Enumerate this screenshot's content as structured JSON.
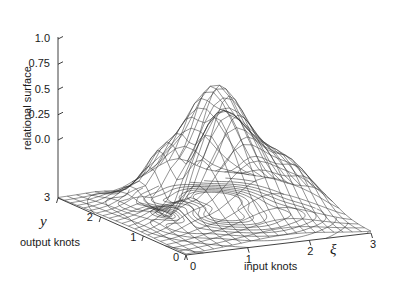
{
  "figure": {
    "width": 394,
    "height": 293,
    "background": "#ffffff",
    "line_color": "#2b2b2b",
    "text_color": "#1a1a1a"
  },
  "axes": {
    "z": {
      "title": "relational surface",
      "ticks": [
        "1.0",
        "0.75",
        "0.5",
        "0.25",
        "0.0"
      ],
      "tick_values": [
        1.0,
        0.75,
        0.5,
        0.25,
        0.0
      ],
      "range": [
        0.0,
        1.0
      ]
    },
    "y": {
      "symbol": "y",
      "title": "output knots",
      "ticks": [
        "3",
        "2",
        "1",
        "0"
      ],
      "tick_values": [
        3,
        2,
        1,
        0
      ],
      "range": [
        0,
        3
      ]
    },
    "x": {
      "symbol": "ξ",
      "title": "input knots",
      "ticks": [
        "0",
        "1",
        "2",
        "3"
      ],
      "tick_values": [
        0,
        1,
        2,
        3
      ],
      "range": [
        0,
        3
      ]
    }
  },
  "chart_data": {
    "type": "surface",
    "title": "",
    "xlabel": "input knots",
    "ylabel": "output knots",
    "zlabel": "relational surface",
    "xlim": [
      0,
      3
    ],
    "ylim": [
      0,
      3
    ],
    "zlim": [
      0,
      1
    ],
    "grid": false,
    "legend": "none",
    "mesh": {
      "nx": 21,
      "ny": 21,
      "style": "wireframe",
      "color": "#2b2b2b"
    },
    "contour": {
      "enabled": true,
      "levels": [
        0.02,
        0.06,
        0.12,
        0.2,
        0.3,
        0.42,
        0.55,
        0.68,
        0.8,
        0.9
      ],
      "projection": "base-plane"
    },
    "view": {
      "azimuth_deg": -37,
      "elevation_deg": 24
    },
    "surface_terms": [
      {
        "amp": 1.0,
        "cx": 2.05,
        "cy": 2.25,
        "sx": 0.42,
        "sy": 0.46
      },
      {
        "amp": 0.6,
        "cx": 1.55,
        "cy": 1.45,
        "sx": 0.33,
        "sy": 0.33
      },
      {
        "amp": 0.42,
        "cx": 1.1,
        "cy": 2.3,
        "sx": 0.3,
        "sy": 0.28
      },
      {
        "amp": 0.34,
        "cx": 2.55,
        "cy": 1.25,
        "sx": 0.34,
        "sy": 0.38
      },
      {
        "amp": -0.22,
        "cx": 1.35,
        "cy": 2.0,
        "sx": 0.22,
        "sy": 0.22
      },
      {
        "amp": -0.16,
        "cx": 2.3,
        "cy": 2.8,
        "sx": 0.26,
        "sy": 0.22
      },
      {
        "amp": 0.3,
        "cx": 1.85,
        "cy": 0.95,
        "sx": 0.4,
        "sy": 0.35
      },
      {
        "amp": 0.18,
        "cx": 0.85,
        "cy": 1.15,
        "sx": 0.3,
        "sy": 0.3
      }
    ]
  }
}
